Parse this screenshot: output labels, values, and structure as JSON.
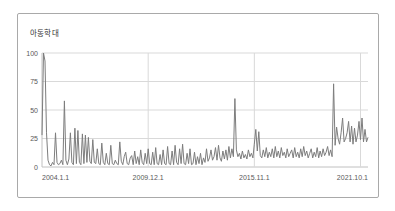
{
  "chart": {
    "title": "아동학대",
    "colors": {
      "background": "#ffffff",
      "frame_border": "#a9a9a9",
      "grid": "#d9d9d9",
      "axis": "#c0c0c0",
      "line": "#7d7d7d",
      "tick_label": "#595959",
      "title_text": "#333333"
    }
  },
  "chart_data": {
    "type": "line",
    "title": "아동학대",
    "frequency": "monthly",
    "x_range": [
      "2004-01",
      "2022-03"
    ],
    "x_ticks": [
      {
        "label": "2004.1.1",
        "month_index": 0
      },
      {
        "label": "2009.12.1",
        "month_index": 71
      },
      {
        "label": "2015.11.1",
        "month_index": 142
      },
      {
        "label": "2021.10.1",
        "month_index": 213
      }
    ],
    "y_ticks": [
      0,
      25,
      50,
      75,
      100
    ],
    "ylim": [
      0,
      100
    ],
    "grid": true,
    "legend_position": "none",
    "series": [
      {
        "name": "아동학대",
        "values": [
          28,
          100,
          93,
          30,
          6,
          2,
          1,
          4,
          2,
          30,
          4,
          2,
          3,
          6,
          2,
          58,
          6,
          2,
          7,
          30,
          4,
          2,
          34,
          3,
          32,
          4,
          2,
          29,
          3,
          28,
          4,
          26,
          5,
          3,
          24,
          4,
          3,
          16,
          3,
          2,
          21,
          4,
          2,
          12,
          3,
          2,
          19,
          3,
          2,
          6,
          3,
          2,
          22,
          5,
          2,
          9,
          13,
          3,
          2,
          8,
          10,
          2,
          14,
          3,
          9,
          2,
          15,
          4,
          2,
          12,
          3,
          16,
          3,
          2,
          13,
          2,
          17,
          3,
          2,
          11,
          2,
          15,
          3,
          2,
          18,
          3,
          2,
          14,
          2,
          19,
          4,
          2,
          16,
          3,
          20,
          3,
          2,
          12,
          3,
          16,
          2,
          3,
          13,
          2,
          9,
          3,
          12,
          2,
          8,
          4,
          16,
          5,
          8,
          15,
          6,
          9,
          17,
          6,
          19,
          8,
          5,
          14,
          7,
          15,
          6,
          18,
          8,
          16,
          9,
          60,
          15,
          9,
          12,
          7,
          14,
          8,
          11,
          7,
          15,
          9,
          12,
          8,
          20,
          33,
          14,
          31,
          10,
          8,
          15,
          9,
          17,
          8,
          13,
          9,
          16,
          8,
          18,
          9,
          14,
          8,
          17,
          10,
          13,
          8,
          16,
          9,
          12,
          15,
          8,
          17,
          9,
          13,
          8,
          16,
          9,
          18,
          10,
          14,
          8,
          12,
          16,
          8,
          13,
          9,
          17,
          8,
          14,
          9,
          16,
          10,
          13,
          18,
          10,
          15,
          9,
          73,
          19,
          35,
          25,
          20,
          30,
          43,
          22,
          25,
          30,
          40,
          22,
          36,
          20,
          34,
          22,
          28,
          40,
          24,
          43,
          22,
          33,
          22,
          26
        ]
      }
    ]
  }
}
